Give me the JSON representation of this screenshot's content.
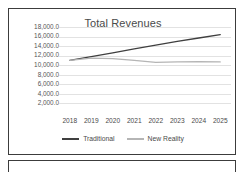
{
  "chart_data": {
    "type": "line",
    "title": "Total Revenues",
    "xlabel": "",
    "ylabel": "",
    "categories": [
      "2018",
      "2019",
      "2020",
      "2021",
      "2022",
      "2023",
      "2024",
      "2025"
    ],
    "ylim": [
      0,
      18000
    ],
    "yticks": [
      2000,
      4000,
      6000,
      8000,
      10000,
      12000,
      14000,
      16000,
      18000
    ],
    "ytick_labels": [
      "2,000.0",
      "4,000.0",
      "6,000.0",
      "8,000.0",
      "10,000.0",
      "12,000.0",
      "14,000.0",
      "16,000.0",
      "18,000.0"
    ],
    "grid": true,
    "legend_position": "bottom",
    "series": [
      {
        "name": "Traditional",
        "color": "#3f3f3f",
        "values": [
          11000.0,
          11800.0,
          12600.0,
          13400.0,
          14200.0,
          15000.0,
          15700.0,
          16400.0
        ]
      },
      {
        "name": "New Reality",
        "color": "#b5b5b5",
        "values": [
          11000.0,
          11500.0,
          11400.0,
          11000.0,
          10600.0,
          10700.0,
          10750.0,
          10700.0
        ]
      }
    ]
  },
  "legend": {
    "items": [
      {
        "label": "Traditional",
        "color": "#3f3f3f"
      },
      {
        "label": "New Reality",
        "color": "#b5b5b5"
      }
    ]
  }
}
